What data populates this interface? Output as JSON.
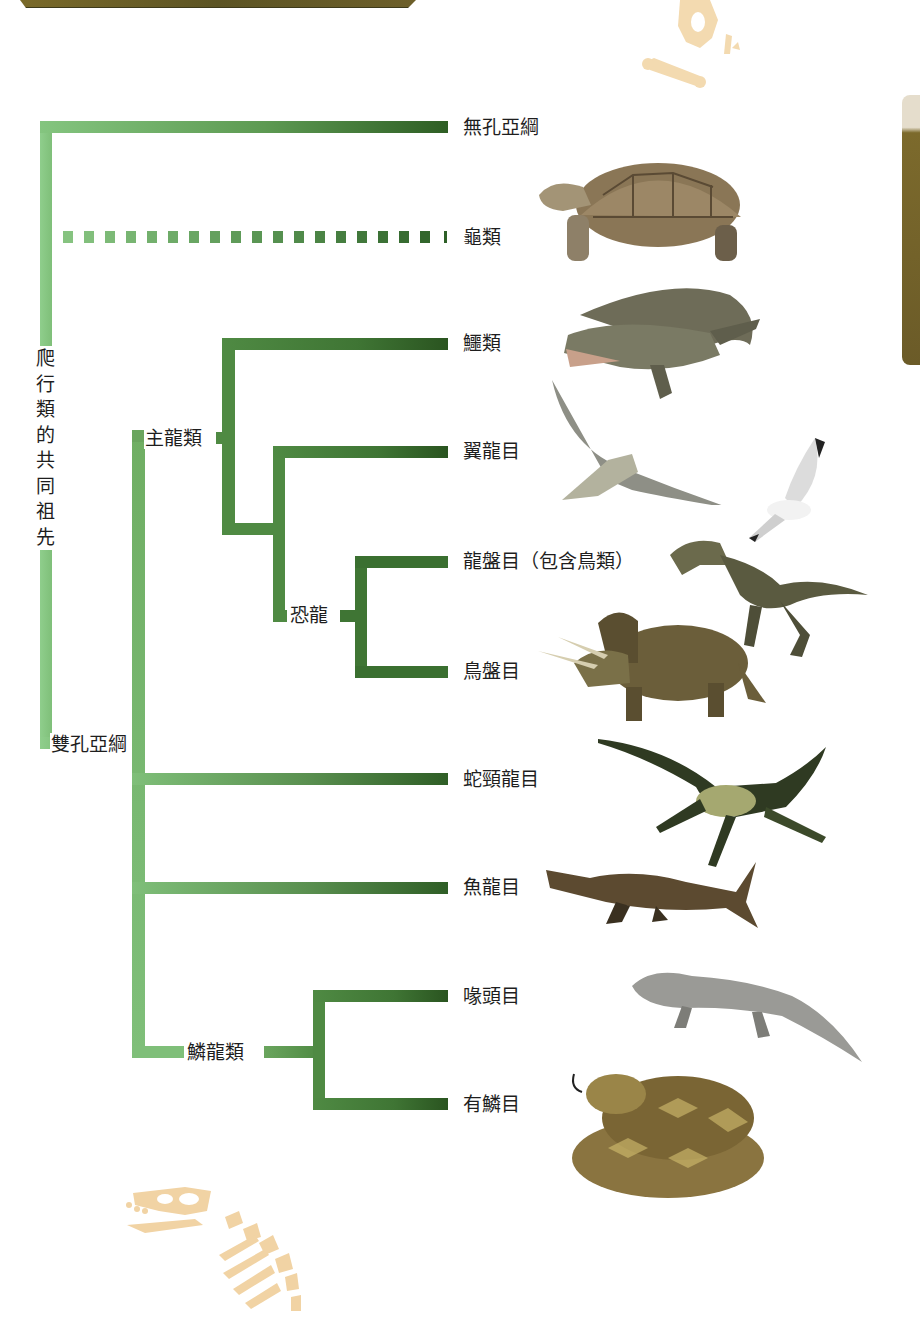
{
  "diagram": {
    "type": "cladogram",
    "title": "",
    "root": {
      "label": "爬行類的共同祖先",
      "children": [
        {
          "label": "無孔亞綱",
          "leaf": true
        },
        {
          "label": "龜類",
          "leaf": true,
          "dashed": true
        },
        {
          "label": "雙孔亞綱",
          "children": [
            {
              "label": "主龍類",
              "children": [
                {
                  "label": "鱷類",
                  "leaf": true
                },
                {
                  "label": "翼龍目",
                  "leaf": true
                },
                {
                  "label": "恐龍",
                  "children": [
                    {
                      "label": "龍盤目（包含鳥類）",
                      "leaf": true
                    },
                    {
                      "label": "鳥盤目",
                      "leaf": true
                    }
                  ]
                }
              ]
            },
            {
              "label": "蛇頸龍目",
              "leaf": true
            },
            {
              "label": "魚龍目",
              "leaf": true
            },
            {
              "label": "鱗龍類",
              "children": [
                {
                  "label": "喙頭目",
                  "leaf": true
                },
                {
                  "label": "有鱗目",
                  "leaf": true
                }
              ]
            }
          ]
        }
      ]
    }
  },
  "labels": {
    "root": "爬行類的共同祖先",
    "root_chars": [
      "爬",
      "行",
      "類",
      "的",
      "共",
      "同",
      "祖",
      "先"
    ],
    "diapsida": "雙孔亞綱",
    "archosauria": "主龍類",
    "dinosauria": "恐龍",
    "lepidosauria": "鱗龍類"
  },
  "leaves": [
    {
      "label": "無孔亞綱",
      "animal": "none"
    },
    {
      "label": "龜類",
      "animal": "tortoise"
    },
    {
      "label": "鱷類",
      "animal": "crocodile"
    },
    {
      "label": "翼龍目",
      "animal": "pterosaur"
    },
    {
      "label": "龍盤目（包含鳥類）",
      "animal": "theropod-and-gull"
    },
    {
      "label": "鳥盤目",
      "animal": "triceratops"
    },
    {
      "label": "蛇頸龍目",
      "animal": "plesiosaur"
    },
    {
      "label": "魚龍目",
      "animal": "ichthyosaur"
    },
    {
      "label": "喙頭目",
      "animal": "tuatara"
    },
    {
      "label": "有鱗目",
      "animal": "rattlesnake"
    }
  ],
  "colors": {
    "branch_light": "#84c57f",
    "branch_mid": "#6aa55e",
    "branch_dark": "#3f7534",
    "branch_end": "#2e5e24",
    "fossil": "#f1d3a4",
    "banner": "#6d5f2a"
  }
}
